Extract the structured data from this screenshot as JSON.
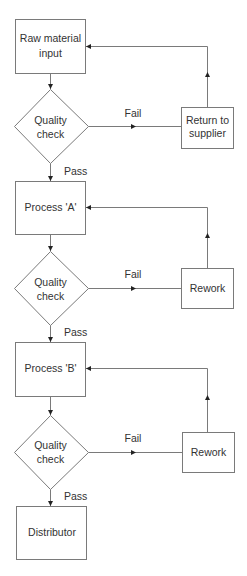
{
  "diagram": {
    "type": "flowchart",
    "colors": {
      "background": "#ffffff",
      "stroke": "#7a7a7a",
      "text": "#333333",
      "arrowhead": "#222222"
    },
    "nodes": {
      "raw_material": {
        "line1": "Raw material",
        "line2": "input"
      },
      "qc1": {
        "line1": "Quality",
        "line2": "check"
      },
      "return_supplier": {
        "line1": "Return to",
        "line2": "supplier"
      },
      "process_a": {
        "label": "Process 'A'"
      },
      "qc2": {
        "line1": "Quality",
        "line2": "check"
      },
      "rework1": {
        "label": "Rework"
      },
      "process_b": {
        "label": "Process 'B'"
      },
      "qc3": {
        "line1": "Quality",
        "line2": "check"
      },
      "rework2": {
        "label": "Rework"
      },
      "distributor": {
        "label": "Distributor"
      }
    },
    "edge_labels": {
      "fail1": "Fail",
      "pass1": "Pass",
      "fail2": "Fail",
      "pass2": "Pass",
      "fail3": "Fail",
      "pass3": "Pass"
    }
  }
}
